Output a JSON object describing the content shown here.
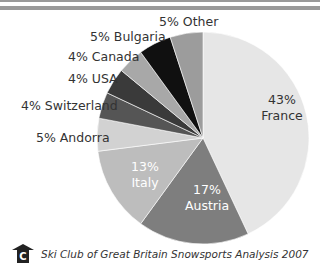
{
  "chart_data": {
    "type": "pie",
    "title": "",
    "start_angle_deg": 0,
    "direction": "clockwise",
    "slices": [
      {
        "label": "France",
        "value": 43,
        "text": "43%\nFrance",
        "color": "#e6e6e6",
        "text_color": "#333333"
      },
      {
        "label": "Austria",
        "value": 17,
        "text": "17%\nAustria",
        "color": "#7e7e7e",
        "text_color": "#ffffff"
      },
      {
        "label": "Italy",
        "value": 13,
        "text": "13%\nItaly",
        "color": "#bdbdbd",
        "text_color": "#ffffff"
      },
      {
        "label": "Andorra",
        "value": 5,
        "text": "5% Andorra",
        "color": "#d2d2d2",
        "text_color": "#333333"
      },
      {
        "label": "Switzerland",
        "value": 4,
        "text": "4% Switzerland",
        "color": "#555555",
        "text_color": "#333333"
      },
      {
        "label": "USA",
        "value": 4,
        "text": "4% USA",
        "color": "#3a3a3a",
        "text_color": "#333333"
      },
      {
        "label": "Canada",
        "value": 4,
        "text": "4% Canada",
        "color": "#a8a8a8",
        "text_color": "#333333"
      },
      {
        "label": "Bulgaria",
        "value": 5,
        "text": "5% Bulgaria",
        "color": "#101010",
        "text_color": "#333333"
      },
      {
        "label": "Other",
        "value": 5,
        "text": "5% Other",
        "color": "#9c9c9c",
        "text_color": "#333333"
      }
    ],
    "legend": "none",
    "labels_position": "outside-left for small slices, inside for large slices"
  },
  "labels": {
    "other": "5% Other",
    "bulgaria": "5% Bulgaria",
    "canada": "4% Canada",
    "usa": "4% USA",
    "switzerland": "4% Switzerland",
    "andorra": "5% Andorra",
    "france": "43%\nFrance",
    "austria": "17%\nAustria",
    "italy": "13%\nItaly"
  },
  "footer": {
    "logo_letter": "C",
    "logo_icon": "ski-club-chalet-logo-icon",
    "source": "Ski Club of Great Britain Snowsports Analysis 2007"
  }
}
